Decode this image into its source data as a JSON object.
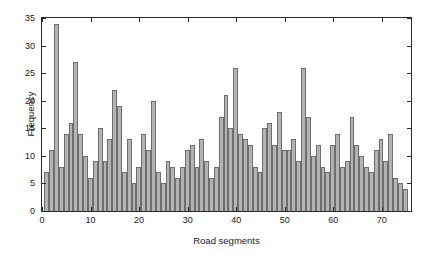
{
  "chart_data": {
    "type": "bar",
    "title": "",
    "subtitle": "",
    "xlabel": "Road segments",
    "ylabel": "Frequency",
    "xlim": [
      0,
      76
    ],
    "ylim": [
      0,
      35
    ],
    "xticks": [
      0,
      10,
      20,
      30,
      40,
      50,
      60,
      70
    ],
    "yticks": [
      0,
      5,
      10,
      15,
      20,
      25,
      30,
      35
    ],
    "grid": false,
    "legend": null,
    "legend_position": "none",
    "bar_color": "#b3b3b3",
    "bar_edge_color": "#6e6e6e",
    "axis_color": "#2b2b2b",
    "categories": [
      1,
      2,
      3,
      4,
      5,
      6,
      7,
      8,
      9,
      10,
      11,
      12,
      13,
      14,
      15,
      16,
      17,
      18,
      19,
      20,
      21,
      22,
      23,
      24,
      25,
      26,
      27,
      28,
      29,
      30,
      31,
      32,
      33,
      34,
      35,
      36,
      37,
      38,
      39,
      40,
      41,
      42,
      43,
      44,
      45,
      46,
      47,
      48,
      49,
      50,
      51,
      52,
      53,
      54,
      55,
      56,
      57,
      58,
      59,
      60,
      61,
      62,
      63,
      64,
      65,
      66,
      67,
      68,
      69,
      70,
      71,
      72,
      73,
      74,
      75
    ],
    "values": [
      7,
      11,
      34,
      8,
      14,
      16,
      27,
      14,
      10,
      6,
      9,
      15,
      9,
      13,
      22,
      19,
      7,
      13,
      5,
      8,
      14,
      11,
      20,
      7,
      5,
      9,
      8,
      6,
      8,
      11,
      12,
      8,
      13,
      9,
      6,
      8,
      17,
      21,
      15,
      26,
      14,
      13,
      12,
      8,
      7,
      15,
      16,
      12,
      18,
      11,
      11,
      13,
      9,
      26,
      17,
      10,
      12,
      8,
      7,
      12,
      14,
      8,
      9,
      17,
      12,
      10,
      8,
      7,
      11,
      13,
      9,
      14,
      6,
      5,
      4
    ]
  },
  "axis_titles": {
    "x": "Road segments",
    "y": "Frequency"
  }
}
